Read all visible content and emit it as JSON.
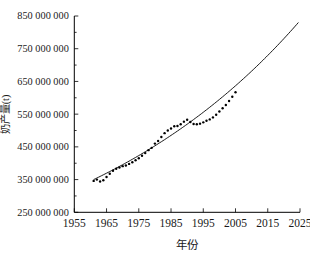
{
  "chart_data": {
    "type": "scatter",
    "title": "",
    "xlabel": "年份",
    "ylabel": "奶产量(t)",
    "xlim": [
      1955,
      2025
    ],
    "ylim": [
      250000000,
      850000000
    ],
    "x_ticks": [
      1955,
      1965,
      1975,
      1985,
      1995,
      2005,
      2015,
      2025
    ],
    "x_tick_labels": [
      "1955",
      "1965",
      "1975",
      "1985",
      "1995",
      "2005",
      "2015",
      "2025"
    ],
    "y_ticks": [
      250000000,
      350000000,
      450000000,
      550000000,
      650000000,
      750000000,
      850000000
    ],
    "y_tick_labels": [
      "250 000 000",
      "350 000 000",
      "450 000 000",
      "550 000 000",
      "650 000 000",
      "750 000 000",
      "850 000 000"
    ],
    "y_minor_ticks": [
      300000000,
      400000000,
      500000000,
      600000000,
      700000000,
      800000000
    ],
    "grid": false,
    "legend": false,
    "series": [
      {
        "name": "observed-milk-production",
        "type": "scatter",
        "marker": "dot",
        "color": "#000000",
        "x": [
          1961,
          1962,
          1963,
          1964,
          1965,
          1966,
          1967,
          1968,
          1969,
          1970,
          1971,
          1972,
          1973,
          1974,
          1975,
          1976,
          1977,
          1978,
          1979,
          1980,
          1981,
          1982,
          1983,
          1984,
          1985,
          1986,
          1987,
          1988,
          1989,
          1990,
          1991,
          1992,
          1993,
          1994,
          1995,
          1996,
          1997,
          1998,
          1999,
          2000,
          2001,
          2002,
          2003,
          2004,
          2005
        ],
        "y": [
          346000000,
          350000000,
          344000000,
          348000000,
          358000000,
          368000000,
          377000000,
          383000000,
          387000000,
          391000000,
          393000000,
          398000000,
          403000000,
          409000000,
          415000000,
          423000000,
          431000000,
          440000000,
          447000000,
          460000000,
          468000000,
          480000000,
          492000000,
          500000000,
          506000000,
          513000000,
          514000000,
          519000000,
          527000000,
          533000000,
          526000000,
          520000000,
          519000000,
          521000000,
          525000000,
          530000000,
          534000000,
          540000000,
          548000000,
          558000000,
          568000000,
          578000000,
          590000000,
          603000000,
          617000000
        ]
      },
      {
        "name": "exponential-fit-curve",
        "type": "line",
        "color": "#000000",
        "fit": {
          "model": "exponential",
          "y0_tonnes": 350000000,
          "growth_rate_per_year": 0.0136,
          "base_year": 1961,
          "x_start": 1961,
          "x_end": 2024.5,
          "y_end_tonnes": 826000000
        }
      }
    ]
  }
}
